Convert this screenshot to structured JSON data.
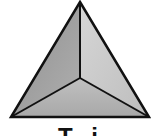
{
  "figure": {
    "shape": "tetrahedron",
    "vertices": {
      "apex": [
        80,
        2
      ],
      "center": [
        80,
        78
      ],
      "base_left": [
        11,
        117
      ],
      "base_right": [
        149,
        117
      ]
    },
    "colors": {
      "left_face": "#9e9e9e",
      "right_face": "#cacaca",
      "bottom_face": "#b2b2b2",
      "edge": "#111111"
    }
  },
  "label": {
    "text": "T   i",
    "clipped": true
  }
}
